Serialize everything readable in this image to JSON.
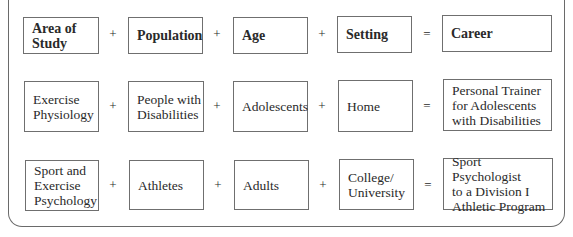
{
  "header": {
    "cells": [
      "Area of\nStudy",
      "Population",
      "Age",
      "Setting",
      "Career"
    ],
    "operators": [
      "+",
      "+",
      "+",
      "="
    ]
  },
  "rows": [
    {
      "cells": [
        "Exercise\nPhysiology",
        "People with\nDisabilities",
        "Adolescents",
        "Home",
        "Personal Trainer\nfor Adolescents\nwith Disabilities"
      ],
      "operators": [
        "+",
        "+",
        "+",
        "="
      ]
    },
    {
      "cells": [
        "Sport and\nExercise\nPsychology",
        "Athletes",
        "Adults",
        "College/\nUniversity",
        "Sport Psychologist\nto a Division I\nAthletic Program"
      ],
      "operators": [
        "+",
        "+",
        "+",
        "="
      ]
    }
  ]
}
